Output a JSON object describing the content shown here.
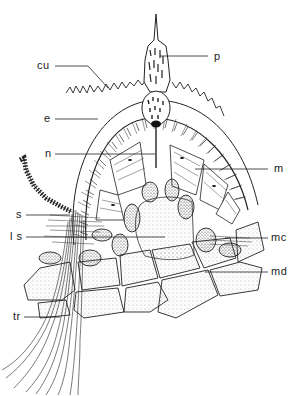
{
  "figure": {
    "labels": [
      {
        "id": "p",
        "text": "p",
        "x": 214,
        "y": 51
      },
      {
        "id": "cu",
        "text": "cu",
        "x": 37,
        "y": 58
      },
      {
        "id": "e",
        "text": "e",
        "x": 45,
        "y": 114
      },
      {
        "id": "n",
        "text": "n",
        "x": 45,
        "y": 149
      },
      {
        "id": "m",
        "text": "m",
        "x": 274,
        "y": 164
      },
      {
        "id": "s",
        "text": "s",
        "x": 17,
        "y": 210
      },
      {
        "id": "ls",
        "text": "l s",
        "x": 11,
        "y": 232
      },
      {
        "id": "mc",
        "text": "mc",
        "x": 272,
        "y": 232
      },
      {
        "id": "md",
        "text": "md",
        "x": 272,
        "y": 266
      },
      {
        "id": "tr",
        "text": "tr",
        "x": 14,
        "y": 312
      }
    ]
  }
}
